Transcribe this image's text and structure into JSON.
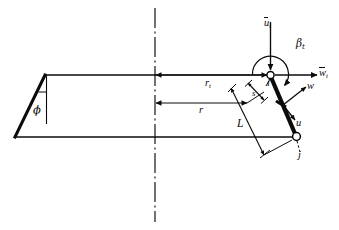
{
  "figure": {
    "type": "engineering-line-diagram",
    "background_color": "#ffffff",
    "line_color": "#0b0b0b"
  },
  "labels": {
    "u_tip": {
      "symbol": "u",
      "overbar": true,
      "subscript": "t",
      "meaning": "tip blade speed vector"
    },
    "w_tip": {
      "symbol": "w",
      "overbar": true,
      "subscript": "t",
      "meaning": "tip relative velocity vector"
    },
    "beta_tip": {
      "symbol": "β",
      "overbar": false,
      "subscript": "t",
      "meaning": "tip flow angle"
    },
    "r_tip": {
      "symbol": "r",
      "overbar": false,
      "subscript": "t",
      "meaning": "tip radius"
    },
    "r": {
      "symbol": "r",
      "overbar": false,
      "subscript": "",
      "meaning": "local radius"
    },
    "s": {
      "symbol": "s",
      "overbar": false,
      "subscript": "",
      "meaning": "spanwise station"
    },
    "L": {
      "symbol": "L",
      "overbar": false,
      "subscript": "",
      "meaning": "blade length"
    },
    "i": {
      "symbol": "i",
      "overbar": false,
      "subscript": "",
      "meaning": "node i (tip joint)"
    },
    "j": {
      "symbol": "j",
      "overbar": false,
      "subscript": "",
      "meaning": "node j (root joint)"
    },
    "w": {
      "symbol": "w",
      "overbar": false,
      "subscript": "",
      "meaning": "relative velocity component"
    },
    "u": {
      "symbol": "u",
      "overbar": false,
      "subscript": "",
      "meaning": "blade speed component"
    },
    "phi": {
      "symbol": "ϕ",
      "overbar": false,
      "subscript": "",
      "meaning": "cone / rake angle"
    }
  },
  "annotations": {
    "centerline": "axis of rotation (dash-dot)",
    "dimension_lines": [
      "r_t",
      "r",
      "s",
      "L"
    ],
    "joints": [
      "i",
      "j"
    ]
  }
}
